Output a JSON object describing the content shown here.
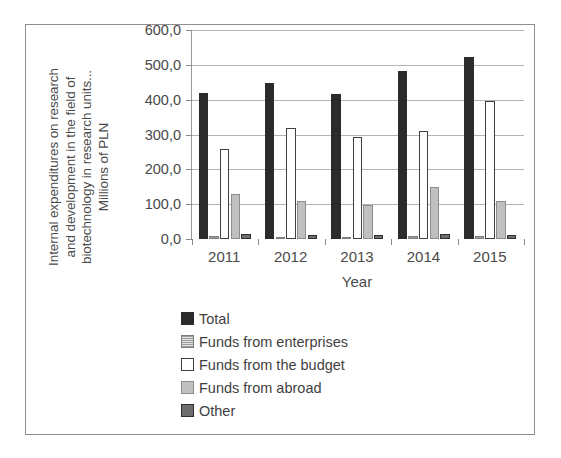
{
  "chart_data": {
    "type": "bar",
    "title": "",
    "xlabel": "Year",
    "ylabel": "Internal expenditures on research and development in the field of biotechnology in research units... Millions of PLN",
    "ylabel_lines": [
      "Internal expenditures on research",
      "and development in the field of",
      "biotechnology in research units...",
      "Millions of PLN"
    ],
    "categories": [
      "2011",
      "2012",
      "2013",
      "2014",
      "2015"
    ],
    "ylim": [
      0,
      600
    ],
    "ytick_values": [
      0,
      100,
      200,
      300,
      400,
      500,
      600
    ],
    "ytick_labels": [
      "0,0",
      "100,0",
      "200,0",
      "300,0",
      "400,0",
      "500,0",
      "600,0"
    ],
    "grid": true,
    "legend_position": "bottom",
    "series": [
      {
        "name": "Total",
        "style": "solid-black",
        "color": "#2b2b2b",
        "values": [
          420.0,
          448.0,
          415.0,
          483.0,
          523.0
        ]
      },
      {
        "name": "Funds from enterprises",
        "style": "hatched-light",
        "color": "#c9c9c9",
        "values": [
          10.0,
          5.0,
          7.0,
          8.0,
          10.0
        ]
      },
      {
        "name": "Funds from the budget",
        "style": "white-outlined",
        "color": "#ffffff",
        "values": [
          258.0,
          318.0,
          292.0,
          310.0,
          397.0
        ]
      },
      {
        "name": "Funds from abroad",
        "style": "mid-gray",
        "color": "#c0c0c0",
        "values": [
          130.0,
          108.0,
          98.0,
          148.0,
          108.0
        ]
      },
      {
        "name": "Other",
        "style": "dark-gray-outlined",
        "color": "#6e6e6e",
        "values": [
          13.0,
          12.0,
          12.0,
          15.0,
          12.0
        ]
      }
    ]
  }
}
